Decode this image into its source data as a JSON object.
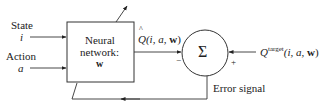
{
  "diagram": {
    "inputs": [
      {
        "label": "State",
        "symbol": "i"
      },
      {
        "label": "Action",
        "symbol": "a"
      }
    ],
    "network_box": {
      "line1": "Neural",
      "line2": "network:",
      "line3": "w"
    },
    "q_hat": {
      "symbol": "Q",
      "args": "(i, a, ",
      "w": "w",
      "close": ")",
      "hat": "^"
    },
    "summation": {
      "symbol": "Σ",
      "minus": "−",
      "plus": "+"
    },
    "q_target": {
      "symbol": "Q",
      "sup": "target",
      "args": "(i, a, ",
      "w": "w",
      "close": ")"
    },
    "error_label": "Error signal"
  }
}
